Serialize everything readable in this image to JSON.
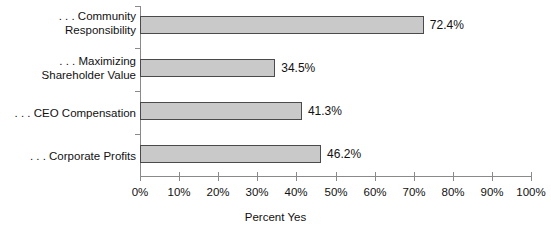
{
  "chart_data": {
    "type": "bar",
    "orientation": "horizontal",
    "title": "",
    "subtitle": "",
    "xlabel": "Percent Yes",
    "ylabel": "",
    "xlim": [
      0,
      100
    ],
    "xtick_labels": [
      "0%",
      "10%",
      "20%",
      "30%",
      "40%",
      "50%",
      "60%",
      "70%",
      "80%",
      "90%",
      "100%"
    ],
    "xtick_values": [
      0,
      10,
      20,
      30,
      40,
      50,
      60,
      70,
      80,
      90,
      100
    ],
    "grid": false,
    "legend": null,
    "categories": [
      ". . . Community\nResponsibility",
      ". . . Maximizing\nShareholder Value",
      ". . . CEO Compensation",
      ". . . Corporate Profits"
    ],
    "values": [
      72.4,
      34.5,
      41.3,
      46.2
    ],
    "data_labels": [
      "72.4%",
      "34.5%",
      "41.3%",
      "46.2%"
    ],
    "bar_fill_color": "#c9c9c9",
    "bar_border_color": "#4a4a4a",
    "axis_color": "#8a8a8a",
    "text_color": "#111111",
    "background_color": "#ffffff"
  }
}
